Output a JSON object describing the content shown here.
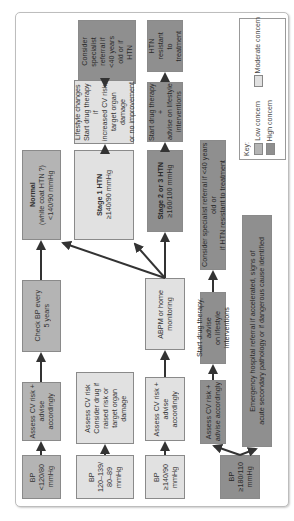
{
  "diagram": {
    "boxes": {
      "bp_low": "BP\n<120/80\nmmHg",
      "bp_mid": "BP\n120–139/\n80–89\nmmHg",
      "bp_140": "BP\n≥140/90\nmmHg",
      "bp_180": "BP\n≥180/110\nmmHg",
      "assess_low": "Assess CV risk +\nadvise\naccordingly",
      "assess_mid": "Assess CV risk\nConsider drug if\nraised risk or\ntarget organ\ndamage",
      "assess_140": "Assess CV risk +\nadvise\naccordingly",
      "assess_180": "Assess CV risk +\nadvise accordingly",
      "check_bp": "Check BP every\n5 years",
      "abpm": "ABPM or home\nmonitoring",
      "normal_title": "Normal",
      "normal_text": "(white coat HTN ?)\n<140/90 mmHg",
      "stage1_title": "Stage 1 HTN",
      "stage1_text": "≥140/90 mmHg",
      "stage23_title": "Stage 2 or 3 HTN",
      "stage23_text": "≥160/100 mmHg",
      "lifestyle": "Lifestyle changes\nStart drug therapy if\nincreased CV risk,\ntarget organ damage\nor no improvement",
      "start_drug_stage23": "Start drug therapy +\nadvise on lifestyle\ninterventions",
      "refer_stage1": "Consider\nspecialist\nreferral if\n<40 years\nold or if\nHTN",
      "refer_stage23": "HTN\nresistant\nto\ntreatment",
      "start_drug_180": "Start drug therapy, advise\non lifestyle interventions",
      "refer_180": "Consider specialist referral if <40 years old or\nif HTN resistant to treatment",
      "emergency": "Emergency hospital referral if accelerated, signs of\nacute secondary pathology or if dangerous cause identified"
    },
    "key": {
      "title": "Key:",
      "low": "Low concern",
      "moderate": "Moderate concern",
      "high": "High concern"
    },
    "colors": {
      "low": "#b4b4b4",
      "moderate": "#e1e1e1",
      "high": "#8f8f8f",
      "arrow": "#333333"
    }
  }
}
